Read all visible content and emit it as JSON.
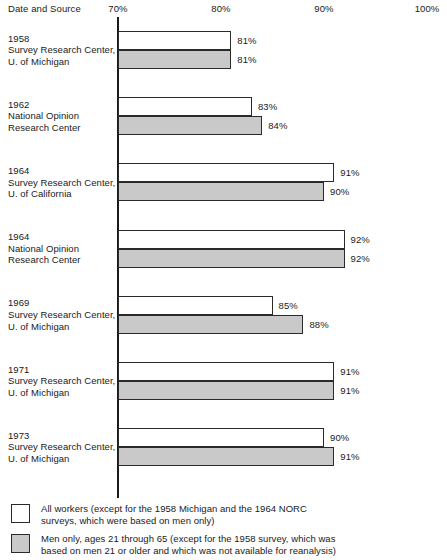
{
  "chart_data": {
    "type": "bar",
    "orientation": "horizontal",
    "title": "",
    "xlabel": "",
    "ylabel": "Date and Source",
    "xlim": [
      70,
      100
    ],
    "grid": false,
    "legend_position": "bottom-left",
    "axis_title": "Date and Source",
    "tick_labels": [
      "70%",
      "80%",
      "90%",
      "100%"
    ],
    "tick_values": [
      70,
      80,
      90,
      100
    ],
    "categories": [
      "1958 Survey Research Center, U. of Michigan",
      "1962 National Opinion Research Center",
      "1964 Survey Research Center, U. of California",
      "1964 National Opinion Research Center",
      "1969 Survey Research Center, U. of Michigan",
      "1971 Survey Research Center, U. of Michigan",
      "1973 Survey Research Center, U. of Michigan"
    ],
    "series": [
      {
        "name": "All workers",
        "values": [
          81,
          83,
          91,
          92,
          85,
          91,
          90
        ],
        "labels": [
          "81%",
          "83%",
          "91%",
          "92%",
          "85%",
          "91%",
          "90%"
        ],
        "color": "#ffffff"
      },
      {
        "name": "Men only, ages 21 through 65",
        "values": [
          81,
          84,
          90,
          92,
          88,
          91,
          91
        ],
        "labels": [
          "81%",
          "84%",
          "90%",
          "92%",
          "88%",
          "91%",
          "91%"
        ],
        "color": "#c9c9c9"
      }
    ]
  },
  "groups": [
    {
      "lines": [
        "1958",
        "Survey Research Center,",
        "U. of Michigan"
      ],
      "all": {
        "value": 81,
        "label": "81%"
      },
      "men": {
        "value": 81,
        "label": "81%"
      }
    },
    {
      "lines": [
        "1962",
        "National Opinion",
        "Research Center"
      ],
      "all": {
        "value": 83,
        "label": "83%"
      },
      "men": {
        "value": 84,
        "label": "84%"
      }
    },
    {
      "lines": [
        "1964",
        "Survey Research Center,",
        "U. of California"
      ],
      "all": {
        "value": 91,
        "label": "91%"
      },
      "men": {
        "value": 90,
        "label": "90%"
      }
    },
    {
      "lines": [
        "1964",
        "National Opinion",
        "Research Center"
      ],
      "all": {
        "value": 92,
        "label": "92%"
      },
      "men": {
        "value": 92,
        "label": "92%"
      }
    },
    {
      "lines": [
        "1969",
        "Survey Research Center,",
        "U. of Michigan"
      ],
      "all": {
        "value": 85,
        "label": "85%"
      },
      "men": {
        "value": 88,
        "label": "88%"
      }
    },
    {
      "lines": [
        "1971",
        "Survey Research Center,",
        "U. of Michigan"
      ],
      "all": {
        "value": 91,
        "label": "91%"
      },
      "men": {
        "value": 91,
        "label": "91%"
      }
    },
    {
      "lines": [
        "1973",
        "Survey Research Center,",
        "U. of Michigan"
      ],
      "all": {
        "value": 90,
        "label": "90%"
      },
      "men": {
        "value": 91,
        "label": "91%"
      }
    }
  ],
  "axis": {
    "title": "Date and Source",
    "ticks": [
      {
        "label": "70%",
        "value": 70
      },
      {
        "label": "80%",
        "value": 80
      },
      {
        "label": "90%",
        "value": 90
      },
      {
        "label": "100%",
        "value": 100
      }
    ]
  },
  "legend": [
    {
      "swatch": "all",
      "color": "#ffffff",
      "lines": [
        "All workers (except for the 1958 Michigan and the 1964 NORC",
        "surveys, which were based on men only)"
      ]
    },
    {
      "swatch": "men",
      "color": "#c9c9c9",
      "lines": [
        "Men only, ages 21 through 65 (except for the 1958 survey, which was",
        "based on men 21 or older and which was not available for reanalysis)"
      ]
    }
  ]
}
